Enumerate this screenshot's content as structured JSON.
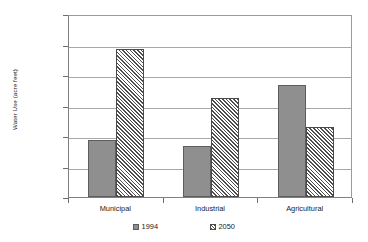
{
  "chart_data": {
    "type": "bar",
    "title": "",
    "subtitle": "",
    "xlabel": "",
    "ylabel": "Water Use (acre feet)",
    "categories": [
      "Municipal",
      "Industrial",
      "Agricultural"
    ],
    "series": [
      {
        "name": "1994",
        "pattern": "solid-gray",
        "color": "#8f8f8f",
        "values": [
          1870000,
          1670000,
          3670000
        ]
      },
      {
        "name": "2050",
        "pattern": "diagonal-hatch",
        "color": "#4d4d4d",
        "values": [
          4850000,
          3250000,
          2300000
        ]
      }
    ],
    "ylim": [
      0,
      6000000
    ],
    "ytick_values": [
      0,
      1000000,
      2000000,
      3000000,
      4000000,
      5000000,
      6000000
    ],
    "ytick_labels": [
      "0",
      "1,000,000",
      "2,000,000",
      "3,000,000",
      "4,000,000",
      "5,000,000",
      "6,000,000"
    ],
    "grid": true,
    "grid_axis": "y",
    "legend_position": "bottom",
    "legend_entries": [
      "1994",
      "2050"
    ],
    "plot_border": true
  }
}
